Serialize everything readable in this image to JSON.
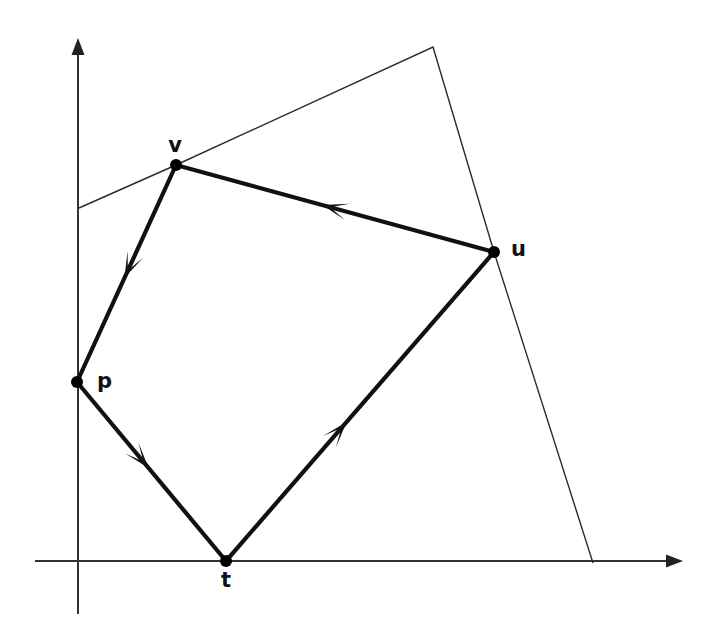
{
  "figure": {
    "kind": "directed-cycle-over-convex-hull-diagram",
    "background_color": "#ffffff",
    "width": 713,
    "height": 621
  },
  "colors": {
    "axis": "#333333",
    "hull": "#2b2b2b",
    "edge": "#111111",
    "dot": "#000000",
    "label": "#111111"
  },
  "axes": {
    "origin": {
      "x": 78,
      "y": 561
    },
    "x_axis": {
      "name": "x-axis",
      "start": {
        "x": 35,
        "y": 561
      },
      "end": {
        "x": 683,
        "y": 561
      },
      "arrow_at": "end",
      "label": ""
    },
    "y_axis": {
      "name": "y-axis",
      "start": {
        "x": 78,
        "y": 614
      },
      "end": {
        "x": 78,
        "y": 38
      },
      "arrow_at": "end",
      "label": ""
    }
  },
  "vertices": [
    {
      "id": "p",
      "label": "p",
      "x": 77,
      "y": 382,
      "label_x": 97,
      "label_y": 382,
      "label_anchor": "start"
    },
    {
      "id": "v",
      "label": "v",
      "x": 176,
      "y": 165,
      "label_x": 175,
      "label_y": 146,
      "label_anchor": "middle"
    },
    {
      "id": "u",
      "label": "u",
      "x": 494,
      "y": 252,
      "label_x": 511,
      "label_y": 250,
      "label_anchor": "start"
    },
    {
      "id": "t",
      "label": "t",
      "x": 226,
      "y": 561,
      "label_x": 226,
      "label_y": 581,
      "label_anchor": "middle"
    }
  ],
  "cycle_edges": [
    {
      "id": "v-to-p",
      "from": "v",
      "to": "p",
      "x1": 176,
      "y1": 165,
      "x2": 77,
      "y2": 382,
      "arrow_t": 0.52,
      "directed": true
    },
    {
      "id": "p-to-t",
      "from": "p",
      "to": "t",
      "x1": 77,
      "y1": 382,
      "x2": 226,
      "y2": 561,
      "arrow_t": 0.48,
      "directed": true
    },
    {
      "id": "t-to-u",
      "from": "t",
      "to": "u",
      "x1": 226,
      "y1": 561,
      "x2": 494,
      "y2": 252,
      "arrow_t": 0.45,
      "directed": true
    },
    {
      "id": "u-to-v",
      "from": "u",
      "to": "v",
      "x1": 494,
      "y1": 252,
      "x2": 176,
      "y2": 165,
      "arrow_t": 0.54,
      "directed": true
    }
  ],
  "hull_polyline": {
    "id": "thin-hull-boundary",
    "points": [
      {
        "x": 79,
        "y": 208
      },
      {
        "x": 176,
        "y": 165
      },
      {
        "x": 433,
        "y": 47
      },
      {
        "x": 494,
        "y": 252
      },
      {
        "x": 593,
        "y": 563
      }
    ]
  },
  "geometry_notes": {
    "dot_radius": 6,
    "edge_stroke_width": 4.2,
    "hull_stroke_width": 1.4,
    "axis_stroke_width": 2
  }
}
